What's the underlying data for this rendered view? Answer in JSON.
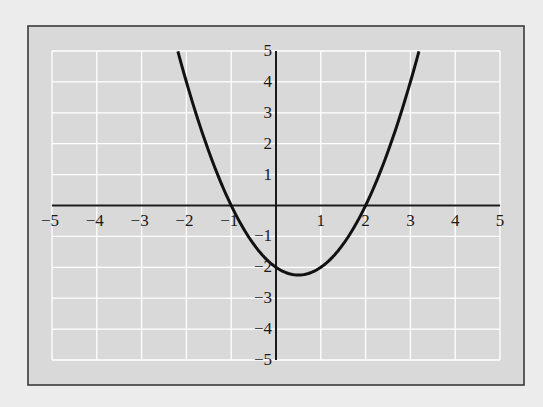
{
  "chart_data": {
    "type": "line",
    "title": "",
    "xlabel": "",
    "ylabel": "",
    "xlim": [
      -5,
      5
    ],
    "ylim": [
      -5,
      5
    ],
    "grid": true,
    "legend": null,
    "x_ticks": [
      -5,
      -4,
      -3,
      -2,
      -1,
      1,
      2,
      3,
      4,
      5
    ],
    "y_ticks": [
      5,
      4,
      3,
      2,
      1,
      -1,
      -2,
      -3,
      -4,
      -5
    ],
    "x_tick_labels": [
      "−5",
      "−4",
      "−3",
      "−2",
      "−1",
      "1",
      "2",
      "3",
      "4",
      "5"
    ],
    "y_tick_labels": [
      "5",
      "4",
      "3",
      "2",
      "1",
      "−1",
      "−2",
      "−3",
      "−4",
      "−5"
    ],
    "series": [
      {
        "name": "parabola",
        "equation": "y = x^2 - x - 2",
        "x": [
          -2.19,
          -2.0,
          -1.5,
          -1.0,
          -0.5,
          0.0,
          0.5,
          1.0,
          1.5,
          2.0,
          2.5,
          3.0,
          3.19
        ],
        "y": [
          5.0,
          4.0,
          1.75,
          0.0,
          -1.25,
          -2.0,
          -2.25,
          -2.0,
          -1.25,
          0.0,
          1.75,
          4.0,
          5.0
        ],
        "x_intercepts": [
          -1,
          2
        ],
        "y_intercept": -2,
        "vertex": [
          0.5,
          -2.25
        ],
        "domain_shown": [
          -2.19,
          3.19
        ]
      }
    ]
  },
  "style": {
    "page_background": "#ececec",
    "panel_fill": "#d9d9d9",
    "panel_border": "#3a3a3a",
    "grid_color": "#ffffff",
    "axis_color": "#1a1a1a",
    "curve_color": "#111111"
  },
  "layout": {
    "panel": {
      "x": 28,
      "y": 26,
      "w": 496,
      "h": 359
    },
    "plot": {
      "x0": 52,
      "x1": 500,
      "y0": 51,
      "y1": 360
    }
  }
}
